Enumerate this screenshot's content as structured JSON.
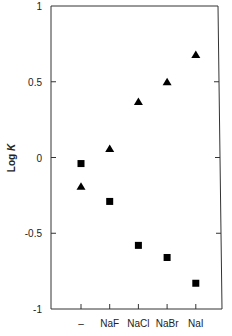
{
  "chart_data": {
    "type": "scatter",
    "title": "",
    "xlabel": "",
    "ylabel": "Log K",
    "ylabel_parts": {
      "prefix": "Log ",
      "italic": "K"
    },
    "categories": [
      "–",
      "NaF",
      "NaCl",
      "NaBr",
      "NaI"
    ],
    "ylim": [
      -1,
      1
    ],
    "yticks": [
      1,
      0.5,
      0,
      -0.5,
      -1
    ],
    "ytick_labels": [
      "1",
      "0.5",
      "0",
      "-0.5",
      "-1"
    ],
    "grid": false,
    "legend": null,
    "series": [
      {
        "name": "triangles",
        "marker": "triangle",
        "color": "#000000",
        "values": [
          -0.19,
          0.06,
          0.37,
          0.5,
          0.68
        ]
      },
      {
        "name": "squares",
        "marker": "square",
        "color": "#000000",
        "values": [
          -0.04,
          -0.29,
          -0.58,
          -0.66,
          -0.83
        ]
      }
    ]
  }
}
